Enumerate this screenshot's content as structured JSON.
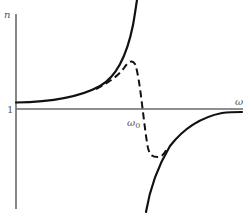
{
  "diagram": {
    "axes": {
      "y_label": "n",
      "x_label": "ω",
      "reference_level_label": "1",
      "resonance_label_main": "ω",
      "resonance_label_sub": "0"
    },
    "curves": [
      {
        "name": "solid-below-resonance",
        "style": "solid",
        "description": "Rises from slightly above n=1 and diverges upward as ω approaches ω0"
      },
      {
        "name": "dashed-damped-response",
        "style": "dashed",
        "description": "Follows solid curve, peaks before ω0, drops through n=1 at ω0, minimum below 1, rejoins lower solid curve"
      },
      {
        "name": "solid-above-resonance",
        "style": "solid",
        "description": "Rises from large negative values just above ω0 and approaches n=1 from below"
      }
    ],
    "colors": {
      "curve": "#111111",
      "axis": "#6a6a6a",
      "label": "#555555",
      "background": "#ffffff"
    }
  }
}
